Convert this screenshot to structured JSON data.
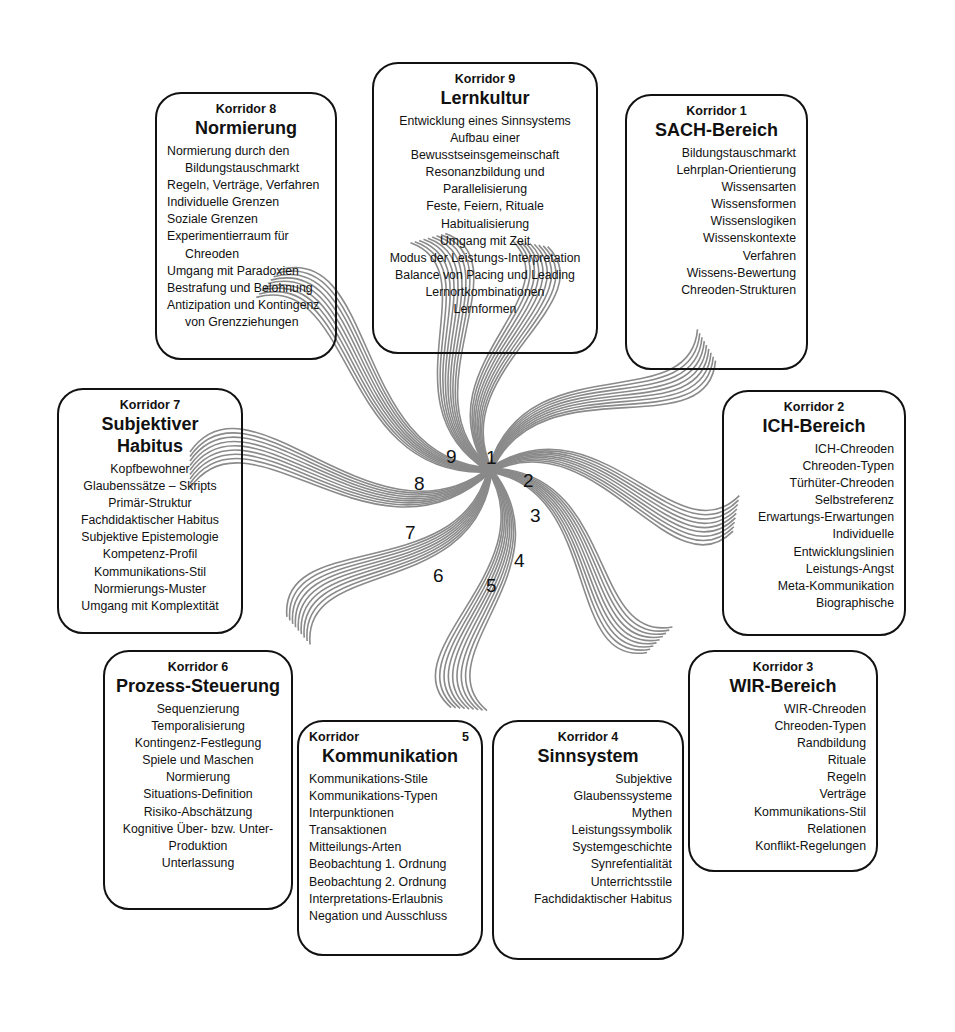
{
  "corridors": [
    {
      "id": 1,
      "label": "Korridor 1",
      "name": "SACH-Bereich",
      "items": [
        "Bildungstauschmarkt",
        "Lehrplan-Orientierung",
        "Wissensarten",
        "Wissensformen",
        "Wissenslogiken",
        "Wissenskontexte",
        "Verfahren",
        "Wissens-Bewertung",
        "Chreoden-Strukturen"
      ]
    },
    {
      "id": 2,
      "label": "Korridor 2",
      "name": "ICH-Bereich",
      "items": [
        "ICH-Chreoden",
        "Chreoden-Typen",
        "Türhüter-Chreoden",
        "Selbstreferenz",
        "Erwartungs-Erwartungen",
        "Individuelle",
        "Entwicklungslinien",
        "Leistungs-Angst",
        "Meta-Kommunikation",
        "Biographische"
      ]
    },
    {
      "id": 3,
      "label": "Korridor 3",
      "name": "WIR-Bereich",
      "items": [
        "WIR-Chreoden",
        "Chreoden-Typen",
        "Randbildung",
        "Rituale",
        "Regeln",
        "Verträge",
        "Kommunikations-Stil",
        "Relationen",
        "Konflikt-Regelungen"
      ]
    },
    {
      "id": 4,
      "label": "Korridor 4",
      "name": "Sinnsystem",
      "items": [
        "Subjektive",
        "Glaubenssysteme",
        "Mythen",
        "Leistungssymbolik",
        "Systemgeschichte",
        "Synrefentialität",
        "Unterrichtsstile",
        "Fachdidaktischer Habitus"
      ]
    },
    {
      "id": 5,
      "label": "Korridor",
      "label_num": "5",
      "name": "Kommunikation",
      "items": [
        "Kommunikations-Stile",
        "Kommunikations-Typen",
        "Interpunktionen",
        "Transaktionen",
        "Mitteilungs-Arten",
        "Beobachtung 1. Ordnung",
        "Beobachtung 2. Ordnung",
        "Interpretations-Erlaubnis",
        "Negation und Ausschluss"
      ]
    },
    {
      "id": 6,
      "label": "Korridor 6",
      "name": "Prozess-Steuerung",
      "items": [
        "Sequenzierung",
        "Temporalisierung",
        "Kontingenz-Festlegung",
        "Spiele und Maschen",
        "Normierung",
        "Situations-Definition",
        "Risiko-Abschätzung",
        "Kognitive Über-  bzw. Unter-",
        "Produktion",
        "Unterlassung"
      ]
    },
    {
      "id": 7,
      "label": "Korridor 7",
      "name": "Subjektiver Habitus",
      "items": [
        "Kopfbewohner",
        "Glaubenssätze – Skripts",
        "Primär-Struktur",
        "Fachdidaktischer Habitus",
        "Subjektive Epistemologie",
        "Kompetenz-Profil",
        "Kommunikations-Stil",
        "Normierungs-Muster",
        "Umgang mit Komplextität"
      ]
    },
    {
      "id": 8,
      "label": "Korridor 8",
      "name": "Normierung",
      "items": [
        "Normierung durch den",
        "   Bildungstauschmarkt",
        "Regeln, Verträge, Verfahren",
        "Individuelle Grenzen",
        "Soziale Grenzen",
        "Experimentierraum für",
        "   Chreoden",
        "Umgang mit Paradoxien",
        "Bestrafung und Belohnung",
        "Antizipation und Kontingenz",
        "   von Grenzziehungen"
      ]
    },
    {
      "id": 9,
      "label": "Korridor 9",
      "name": "Lernkultur",
      "items": [
        "Entwicklung eines Sinnsystems",
        "Aufbau einer",
        "Bewusstseinsgemeinschaft",
        "Resonanzbildung und",
        "Parallelisierung",
        "Feste, Feiern, Rituale",
        "Habitualisierung",
        "Umgang mit Zeit",
        "Modus der Leistungs-Interpretation",
        "Balance von Pacing und Leading",
        "Lernortkombinationen",
        "Lernformen"
      ]
    }
  ],
  "spiral": {
    "center": [
      490,
      470
    ],
    "numbers": [
      "1",
      "2",
      "3",
      "4",
      "5",
      "6",
      "7",
      "8",
      "9"
    ],
    "line_color": "#8a8a8a"
  }
}
